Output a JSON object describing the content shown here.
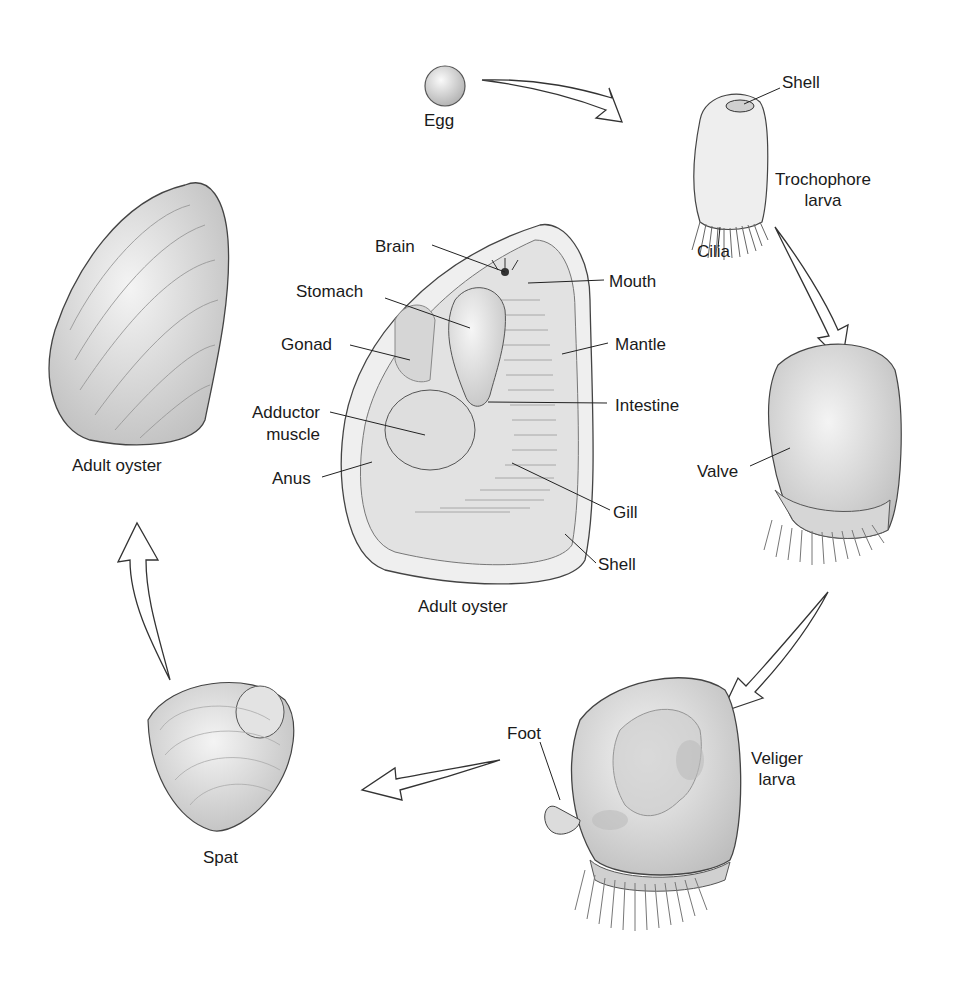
{
  "diagram": {
    "stages": [
      {
        "id": "egg",
        "label": "Egg"
      },
      {
        "id": "trochophore",
        "label": "Trochophore larva",
        "parts": [
          "Shell",
          "Cilia"
        ]
      },
      {
        "id": "veliger-early",
        "parts": [
          "Valve"
        ]
      },
      {
        "id": "veliger",
        "label": "Veliger larva",
        "parts": [
          "Foot"
        ]
      },
      {
        "id": "spat",
        "label": "Spat"
      },
      {
        "id": "adult",
        "label": "Adult oyster"
      }
    ],
    "labels": {
      "egg": "Egg",
      "shell_top": "Shell",
      "trochophore_1": "Trochophore",
      "trochophore_2": "larva",
      "cilia": "Cilia",
      "valve": "Valve",
      "foot": "Foot",
      "veliger_1": "Veliger",
      "veliger_2": "larva",
      "spat": "Spat",
      "adult_left": "Adult oyster",
      "adult_center": "Adult oyster"
    },
    "anatomy": {
      "brain": "Brain",
      "stomach": "Stomach",
      "gonad": "Gonad",
      "adductor_1": "Adductor",
      "adductor_2": "muscle",
      "anus": "Anus",
      "mouth": "Mouth",
      "mantle": "Mantle",
      "intestine": "Intestine",
      "gill": "Gill",
      "shell": "Shell"
    },
    "colors": {
      "line": "#2a2a2a",
      "fill_light": "#ececec",
      "fill_mid": "#d4d4d4",
      "fill_dark": "#a8a8a8"
    }
  }
}
